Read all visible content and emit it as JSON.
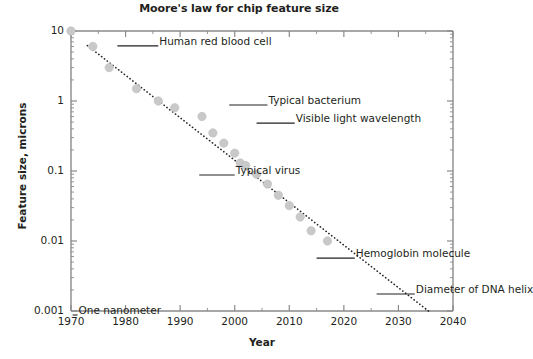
{
  "chart_data": {
    "type": "scatter",
    "title": "Moore's law for chip feature size",
    "xlabel": "Year",
    "ylabel": "Feature size, microns",
    "xlim": [
      1970,
      2040
    ],
    "ylim": [
      0.001,
      10
    ],
    "yscale": "log",
    "grid": false,
    "legend": "none",
    "xticks": [
      "1970",
      "1980",
      "1990",
      "2000",
      "2010",
      "2020",
      "2030",
      "2040"
    ],
    "xtick_values": [
      1970,
      1980,
      1990,
      2000,
      2010,
      2020,
      2030,
      2040
    ],
    "yticks": [
      "10",
      "1",
      "0.1",
      "0.01",
      "0.001"
    ],
    "ytick_values": [
      10,
      1,
      0.1,
      0.01,
      0.001
    ],
    "series": [
      {
        "name": "Chip feature size",
        "marker": "circle",
        "color": "#c9c9c9",
        "points": [
          {
            "x": 1970,
            "y": 10
          },
          {
            "x": 1974,
            "y": 6
          },
          {
            "x": 1977,
            "y": 3
          },
          {
            "x": 1982,
            "y": 1.5
          },
          {
            "x": 1986,
            "y": 1.0
          },
          {
            "x": 1989,
            "y": 0.8
          },
          {
            "x": 1994,
            "y": 0.6
          },
          {
            "x": 1996,
            "y": 0.35
          },
          {
            "x": 1998,
            "y": 0.25
          },
          {
            "x": 2000,
            "y": 0.18
          },
          {
            "x": 2001,
            "y": 0.13
          },
          {
            "x": 2002,
            "y": 0.12
          },
          {
            "x": 2004,
            "y": 0.09
          },
          {
            "x": 2006,
            "y": 0.065
          },
          {
            "x": 2008,
            "y": 0.045
          },
          {
            "x": 2010,
            "y": 0.032
          },
          {
            "x": 2012,
            "y": 0.022
          },
          {
            "x": 2014,
            "y": 0.014
          },
          {
            "x": 2017,
            "y": 0.01
          }
        ]
      }
    ],
    "trend_line": {
      "name": "Moore's law trend",
      "style": "dotted",
      "color": "#231f20",
      "start": {
        "x": 1973,
        "y": 6.2
      },
      "end": {
        "x": 2035.5,
        "y": 0.001
      }
    },
    "annotations": [
      {
        "id": "human-red-blood-cell",
        "text": "Human red blood cell",
        "y_value": 7.0,
        "leader_x1": 1978.5,
        "leader_x2": 1986.0
      },
      {
        "id": "typical-bacterium",
        "text": "Typical bacterium",
        "y_value": 1.0,
        "leader_x1": 1999.0,
        "leader_x2": 2006.0
      },
      {
        "id": "visible-light-wavelength",
        "text": "Visible light wavelength",
        "y_value": 0.55,
        "leader_x1": 2004.0,
        "leader_x2": 2011.0
      },
      {
        "id": "typical-virus",
        "text": "Typical virus",
        "y_value": 0.1,
        "leader_x1": 1993.5,
        "leader_x2": 2000.0
      },
      {
        "id": "hemoglobin-molecule",
        "text": "Hemoglobin molecule",
        "y_value": 0.0065,
        "leader_x1": 2015.0,
        "leader_x2": 2022.0
      },
      {
        "id": "diameter-of-dna-helix",
        "text": "Diameter of DNA helix",
        "y_value": 0.002,
        "leader_x1": 2026.0,
        "leader_x2": 2033.0
      },
      {
        "id": "one-nanometer",
        "text": "One nanometer",
        "y_value": 0.001,
        "leader_x1": 1970.3,
        "leader_x2": 1971.2
      }
    ]
  }
}
